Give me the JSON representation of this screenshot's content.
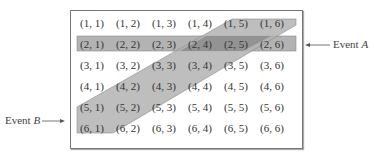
{
  "diagram": {
    "title": "",
    "sample_space": [
      [
        "(1, 1)",
        "(1, 2)",
        "(1, 3)",
        "(1, 4)",
        "(1, 5)",
        "(1, 6)"
      ],
      [
        "(2, 1)",
        "(2, 2)",
        "(2, 3)",
        "(2, 4)",
        "(2, 5)",
        "(2, 6)"
      ],
      [
        "(3, 1)",
        "(3, 2)",
        "(3, 3)",
        "(3, 4)",
        "(3, 5)",
        "(3, 6)"
      ],
      [
        "(4, 1)",
        "(4, 2)",
        "(4, 3)",
        "(4, 4)",
        "(4, 5)",
        "(4, 6)"
      ],
      [
        "(5, 1)",
        "(5, 2)",
        "(5, 3)",
        "(5, 4)",
        "(5, 5)",
        "(5, 6)"
      ],
      [
        "(6, 1)",
        "(6, 2)",
        "(6, 3)",
        "(6, 4)",
        "(6, 5)",
        "(6, 6)"
      ]
    ],
    "event_a": {
      "label_prefix": "Event ",
      "label_var": "A",
      "arrow": "←——",
      "description": "row 2 highlighted",
      "color": "#b3b3b3"
    },
    "event_b": {
      "label_prefix": "Event ",
      "label_var": "B",
      "arrow": "——→",
      "description": "diagonal band (6,1),(5,1),(5,2),(4,2),(4,3),(3,3),(3,4),(2,4),(2,5),(1,5),(1,6)",
      "color": "#b3b3b3"
    },
    "overlap_color": "#8f8f8f",
    "frame_color": "#777777"
  }
}
